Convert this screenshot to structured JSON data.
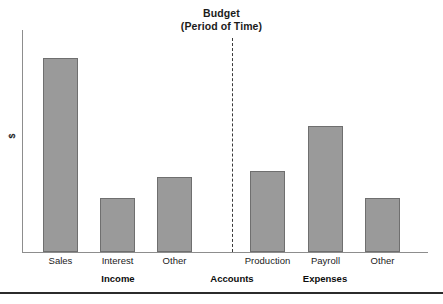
{
  "chart_data": {
    "type": "bar",
    "title": "Budget",
    "subtitle": "(Period of Time)",
    "xlabel": "Accounts",
    "ylabel": "$",
    "grid": false,
    "legend": "none",
    "ylim": [
      0,
      100
    ],
    "axis_tick_labels": [],
    "categories": [
      "Sales",
      "Interest",
      "Other",
      "Production",
      "Payroll",
      "Other"
    ],
    "values": [
      88,
      25,
      34,
      37,
      57,
      25
    ],
    "groups": [
      {
        "name": "Income",
        "categories": [
          "Sales",
          "Interest",
          "Other"
        ],
        "values": [
          88,
          25,
          34
        ]
      },
      {
        "name": "Expenses",
        "categories": [
          "Production",
          "Payroll",
          "Other"
        ],
        "values": [
          37,
          57,
          25
        ]
      }
    ],
    "annotations": [
      {
        "name": "group-divider",
        "type": "vertical-dashed-line",
        "position": "between Income and Expenses"
      }
    ],
    "colors": {
      "bar_fill": "#9a9a9a",
      "bar_stroke": "#6f6f6f",
      "axis": "#8d8d8d",
      "text": "#1b1b1b",
      "divider": "#3a3a3a",
      "bottom_rule": "#2b2b2b"
    }
  },
  "bars": [
    {
      "label": "Sales",
      "group": "Income",
      "value": 88,
      "x": 43,
      "width": 35,
      "top": 58,
      "height": 194
    },
    {
      "label": "Interest",
      "group": "Income",
      "value": 25,
      "x": 100,
      "width": 35,
      "top": 198,
      "height": 54
    },
    {
      "label": "Other",
      "group": "Income",
      "value": 34,
      "x": 157,
      "width": 35,
      "top": 177,
      "height": 75
    },
    {
      "label": "Production",
      "group": "Expenses",
      "value": 37,
      "x": 250,
      "width": 35,
      "top": 171,
      "height": 81
    },
    {
      "label": "Payroll",
      "group": "Expenses",
      "value": 57,
      "x": 308,
      "width": 35,
      "top": 126,
      "height": 126
    },
    {
      "label": "Other",
      "group": "Expenses",
      "value": 25,
      "x": 365,
      "width": 35,
      "top": 198,
      "height": 54
    }
  ],
  "group_labels": [
    {
      "text": "Income",
      "center": 118
    },
    {
      "text": "Accounts",
      "center": 232
    },
    {
      "text": "Expenses",
      "center": 325
    }
  ]
}
